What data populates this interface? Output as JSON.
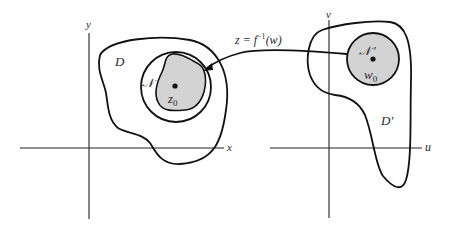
{
  "colors": {
    "ink": "#111111",
    "neighborhood_fill": "#d3d3d3",
    "background": "#ffffff"
  },
  "left_plane": {
    "x_axis_label": "x",
    "y_axis_label": "y",
    "domain_label": "D",
    "neighborhood_label": "𝒩",
    "point_label": "z",
    "point_subscript": "0"
  },
  "right_plane": {
    "u_axis_label": "u",
    "v_axis_label": "v",
    "domain_label": "D′",
    "neighborhood_label": "𝒩 ′",
    "point_label": "w",
    "point_subscript": "0"
  },
  "mapping": {
    "label_lhs": "z = f",
    "label_sup": "−1",
    "label_rhs": "(w)"
  }
}
